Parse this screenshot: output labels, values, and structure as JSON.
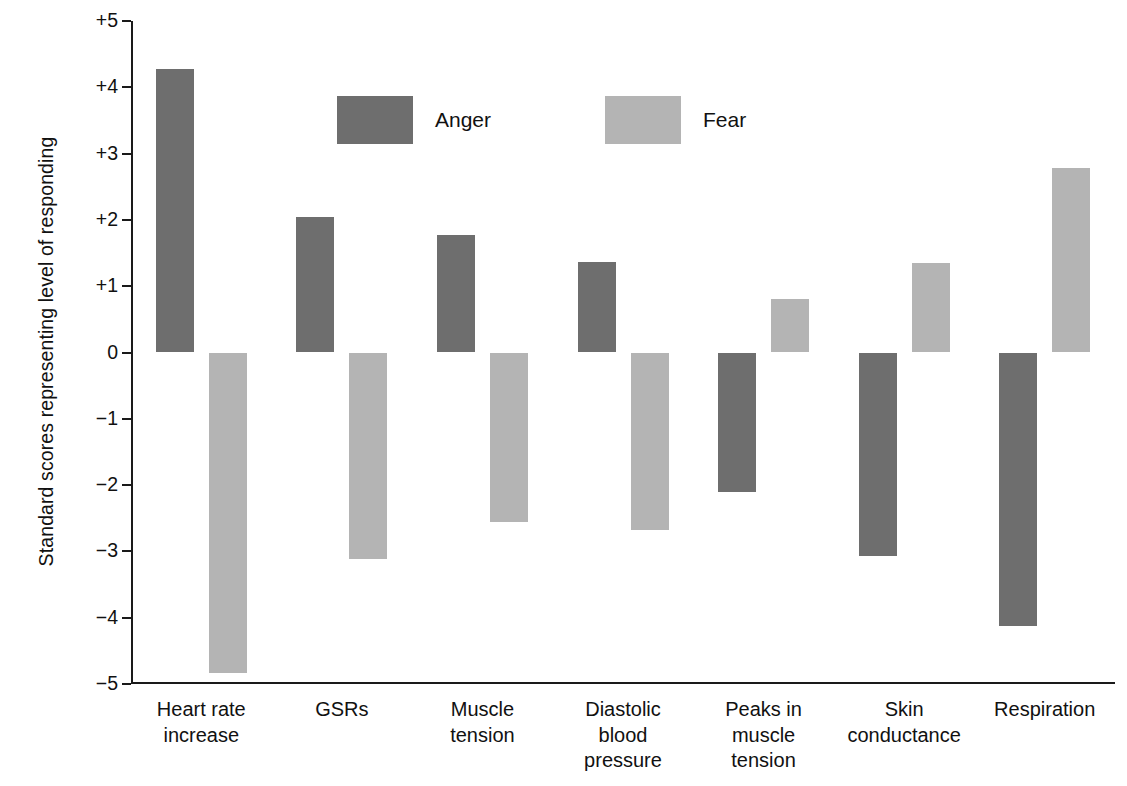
{
  "chart_data": {
    "type": "bar",
    "title": "",
    "subtitle": "",
    "xlabel": "",
    "ylabel": "Standard scores representing level of responding",
    "ylim": [
      -5,
      5
    ],
    "grid": false,
    "legend_position": "upper-center-inside",
    "categories": [
      "Heart rate\nincrease",
      "GSRs",
      "Muscle\ntension",
      "Diastolic\nblood\npressure",
      "Peaks in\nmuscle\ntension",
      "Skin\nconductance",
      "Respiration"
    ],
    "series": [
      {
        "name": "Anger",
        "color": "#6e6e6e",
        "values": [
          4.28,
          2.05,
          1.77,
          1.36,
          -2.11,
          -3.07,
          -4.13
        ]
      },
      {
        "name": "Fear",
        "color": "#b4b4b4",
        "values": [
          -4.84,
          -3.12,
          -2.56,
          -2.68,
          0.81,
          1.35,
          2.79
        ]
      }
    ],
    "yticks": [
      {
        "value": 5,
        "label": "+5"
      },
      {
        "value": 4,
        "label": "+4"
      },
      {
        "value": 3,
        "label": "+3"
      },
      {
        "value": 2,
        "label": "+2"
      },
      {
        "value": 1,
        "label": "+1"
      },
      {
        "value": 0,
        "label": "0"
      },
      {
        "value": -1,
        "label": "−1"
      },
      {
        "value": -2,
        "label": "−2"
      },
      {
        "value": -3,
        "label": "−3"
      },
      {
        "value": -4,
        "label": "−4"
      },
      {
        "value": -5,
        "label": "−5"
      }
    ],
    "legend": [
      {
        "label": "Anger",
        "color": "#6e6e6e"
      },
      {
        "label": "Fear",
        "color": "#b4b4b4"
      }
    ]
  }
}
